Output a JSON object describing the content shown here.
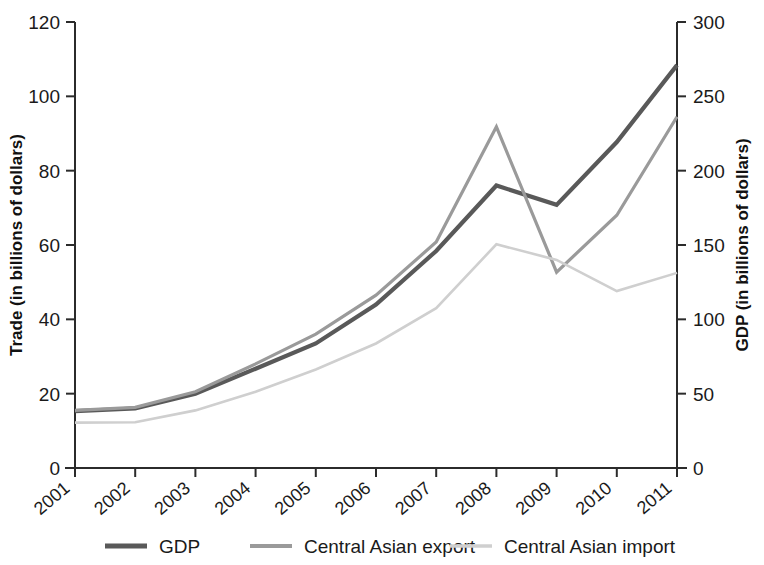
{
  "chart_data": {
    "type": "line",
    "title": "",
    "xlabel": "",
    "ylabel": "Trade (in billions of dollars)",
    "y2label": "GDP (in billions of dollars)",
    "categories": [
      "2001",
      "2002",
      "2003",
      "2004",
      "2005",
      "2006",
      "2007",
      "2008",
      "2009",
      "2010",
      "2011"
    ],
    "ylim": [
      0,
      120
    ],
    "yticks": [
      0,
      20,
      40,
      60,
      80,
      100,
      120
    ],
    "y2lim": [
      0,
      300
    ],
    "y2ticks": [
      0,
      50,
      100,
      150,
      200,
      250,
      300
    ],
    "grid": false,
    "legend_position": "bottom",
    "series": [
      {
        "name": "GDP",
        "axis": "right",
        "color": "#595959",
        "values": [
          38,
          40,
          50,
          67,
          84,
          110,
          146,
          190,
          177,
          219,
          271
        ],
        "values_left_scale": [
          15.3,
          16.0,
          20.0,
          26.7,
          33.5,
          44.0,
          58.4,
          76.0,
          70.8,
          87.7,
          108.4
        ]
      },
      {
        "name": "Central Asian export",
        "axis": "left",
        "color": "#9a9a9a",
        "values": [
          15.5,
          16.3,
          20.5,
          28.0,
          36.0,
          46.5,
          60.8,
          91.8,
          52.7,
          68.0,
          94.5
        ]
      },
      {
        "name": "Central Asian import",
        "axis": "left",
        "color": "#cfcfcf",
        "values": [
          12.2,
          12.3,
          15.5,
          20.5,
          26.5,
          33.5,
          43.0,
          60.2,
          56.0,
          47.6,
          52.5
        ]
      }
    ]
  },
  "axes": {
    "left_title": "Trade (in billions of dollars)",
    "right_title": "GDP (in billions of dollars)",
    "left_ticks": [
      "120",
      "100",
      "80",
      "60",
      "40",
      "20",
      "0"
    ],
    "right_ticks": [
      "300",
      "250",
      "200",
      "150",
      "100",
      "50",
      "0"
    ],
    "x_ticks": [
      "2001",
      "2002",
      "2003",
      "2004",
      "2005",
      "2006",
      "2007",
      "2008",
      "2009",
      "2010",
      "2011"
    ]
  },
  "legend": {
    "items": [
      {
        "label": "GDP",
        "color": "#595959"
      },
      {
        "label": "Central Asian export",
        "color": "#9a9a9a"
      },
      {
        "label": "Central Asian import",
        "color": "#cfcfcf"
      }
    ]
  }
}
